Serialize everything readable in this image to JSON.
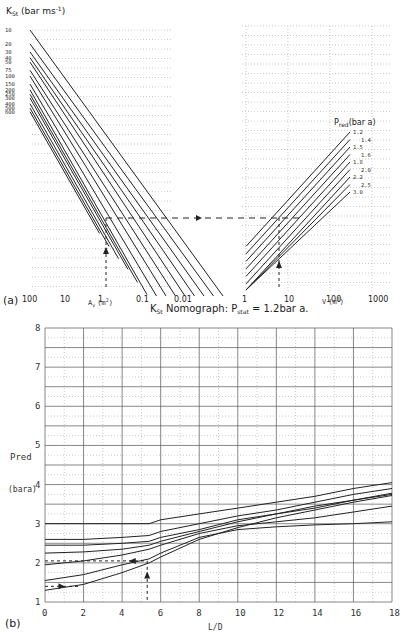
{
  "chart_data": [
    {
      "panel_label": "(a)",
      "type": "line",
      "title": "K_St Nomograph: P_stat = 1.2bar a.",
      "title_parts": {
        "k": "K",
        "k_sub": "St",
        "mid": " Nomograph: P",
        "p_sub": "stat",
        "end": " = 1.2bar a."
      },
      "left_panel": {
        "ylabel": "K_St (bar ms^-1)",
        "ylabel_parts": {
          "k": "K",
          "k_sub": "St",
          "unit": " (bar ms",
          "exp": "-1",
          "close": ")"
        },
        "kst_labels": [
          "10",
          "20",
          "30",
          "40",
          "50",
          "75",
          "100",
          "150",
          "200",
          "250",
          "300",
          "400",
          "500",
          "600"
        ],
        "xlabel": "A_v^1 (m^2)",
        "xlabel_parts": {
          "a": "A",
          "sup": "1",
          "sub": "v",
          "unit": "(m",
          "exp": "2",
          "close": ")"
        },
        "x_ticks": [
          "100",
          "10",
          "1",
          "0.1",
          "0.01"
        ],
        "x_scale": "log, decreasing",
        "series": [
          {
            "name": "K_St=10",
            "kst": 10
          },
          {
            "name": "K_St=20",
            "kst": 20
          },
          {
            "name": "K_St=30",
            "kst": 30
          },
          {
            "name": "K_St=40",
            "kst": 40
          },
          {
            "name": "K_St=50",
            "kst": 50
          },
          {
            "name": "K_St=75",
            "kst": 75
          },
          {
            "name": "K_St=100",
            "kst": 100
          },
          {
            "name": "K_St=150",
            "kst": 150
          },
          {
            "name": "K_St=200",
            "kst": 200
          },
          {
            "name": "K_St=250",
            "kst": 250
          },
          {
            "name": "K_St=300",
            "kst": 300
          },
          {
            "name": "K_St=400",
            "kst": 400
          },
          {
            "name": "K_St=500",
            "kst": 500
          },
          {
            "name": "K_St=600",
            "kst": 600
          }
        ],
        "example_Av": 1
      },
      "right_panel": {
        "legend_title": "P_red (bar a)",
        "legend_parts": {
          "p": "P",
          "sub": "red",
          "unit": "(bar a)"
        },
        "pred_labels": [
          "1.2",
          "1.4",
          "1.5",
          "1.6",
          "1.8",
          "2.0",
          "2.2",
          "2.5",
          "3.0"
        ],
        "xlabel": "V (m^3)",
        "xlabel_parts": {
          "v": "V",
          "unit": "(m",
          "exp": "3",
          "close": ")"
        },
        "x_ticks": [
          "1",
          "10",
          "100",
          "1000"
        ],
        "x_scale": "log",
        "example_V": 5
      }
    },
    {
      "panel_label": "(b)",
      "type": "line",
      "xlabel": "L/D",
      "ylabel": "Pred",
      "ylabel_unit": "(bara)",
      "xlim": [
        0,
        18
      ],
      "ylim": [
        1,
        8
      ],
      "x_ticks": [
        "0",
        "2",
        "4",
        "6",
        "8",
        "10",
        "12",
        "14",
        "16",
        "18"
      ],
      "y_ticks": [
        "1",
        "2",
        "3",
        "4",
        "5",
        "6",
        "7",
        "8"
      ],
      "grid": true,
      "x": [
        0,
        2,
        4,
        5.4,
        6,
        8,
        10,
        12,
        14,
        16,
        18
      ],
      "series": [
        {
          "name": "curve-1",
          "values": [
            3.0,
            3.0,
            3.0,
            3.0,
            3.1,
            3.25,
            3.4,
            3.55,
            3.7,
            3.9,
            4.05
          ]
        },
        {
          "name": "curve-2",
          "values": [
            2.6,
            2.6,
            2.65,
            2.7,
            2.8,
            3.0,
            3.2,
            3.35,
            3.55,
            3.75,
            3.9
          ]
        },
        {
          "name": "curve-3",
          "values": [
            2.45,
            2.45,
            2.5,
            2.55,
            2.65,
            2.85,
            3.1,
            3.25,
            3.45,
            3.6,
            3.75
          ]
        },
        {
          "name": "curve-4",
          "values": [
            2.25,
            2.28,
            2.35,
            2.45,
            2.55,
            2.8,
            3.05,
            3.25,
            3.4,
            3.6,
            3.78
          ]
        },
        {
          "name": "curve-5",
          "values": [
            1.95,
            2.05,
            2.2,
            2.35,
            2.45,
            2.75,
            2.95,
            3.05,
            3.15,
            3.3,
            3.45
          ]
        },
        {
          "name": "curve-6",
          "values": [
            1.55,
            1.7,
            1.95,
            2.1,
            2.25,
            2.65,
            2.85,
            2.92,
            2.97,
            3.0,
            3.05
          ]
        },
        {
          "name": "curve-7",
          "values": [
            1.3,
            1.45,
            1.75,
            2.0,
            2.15,
            2.6,
            2.9,
            3.15,
            3.35,
            3.55,
            3.72
          ]
        }
      ],
      "annotation": {
        "from_LD": 5.3,
        "from_P": 2.05,
        "to_P_at_0": 2.05,
        "lower_marker_P": 1.4
      }
    }
  ]
}
